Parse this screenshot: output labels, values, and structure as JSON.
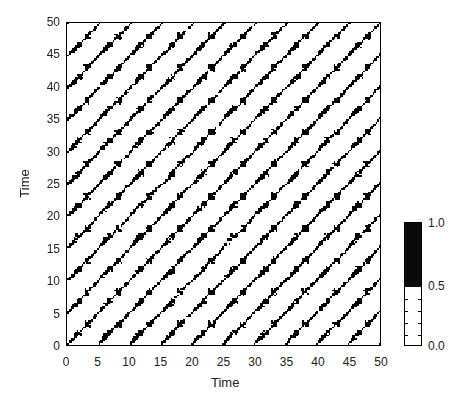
{
  "chart_data": {
    "type": "heatmap",
    "subtype": "recurrence_plot",
    "title": "",
    "xlabel": "Time",
    "ylabel": "Time",
    "xlim": [
      0,
      50
    ],
    "ylim": [
      0,
      50
    ],
    "xticks": [
      "0",
      "5",
      "10",
      "15",
      "20",
      "25",
      "30",
      "35",
      "40",
      "45",
      "50"
    ],
    "yticks": [
      "0",
      "5",
      "10",
      "15",
      "20",
      "25",
      "30",
      "35",
      "40",
      "45",
      "50"
    ],
    "grid": false,
    "colormap": "binary (white = 0, black = 1)",
    "values_description": "Binary recurrence matrix: black where states at times i and j are close (recurrence = 1), white otherwise. Dominant periodic structure with period ~5 time units, producing X-shaped diagonal crossings and a lattice of white diamond regions.",
    "approx_period": 5,
    "resolution": 200,
    "colorbar": {
      "position": "right",
      "ticks": [
        "0.0",
        "0.5",
        "1.0"
      ],
      "range": [
        0,
        1
      ],
      "black_from": 0.5
    }
  },
  "axes": {
    "xlabel": "Time",
    "ylabel": "Time",
    "xticks": [
      "0",
      "5",
      "10",
      "15",
      "20",
      "25",
      "30",
      "35",
      "40",
      "45",
      "50"
    ],
    "yticks": [
      "0",
      "5",
      "10",
      "15",
      "20",
      "25",
      "30",
      "35",
      "40",
      "45",
      "50"
    ]
  },
  "colorbar": {
    "labels": [
      "1.0",
      "0.5",
      "0.0"
    ]
  },
  "style": {
    "foreground": "#000000",
    "background": "#ffffff"
  }
}
